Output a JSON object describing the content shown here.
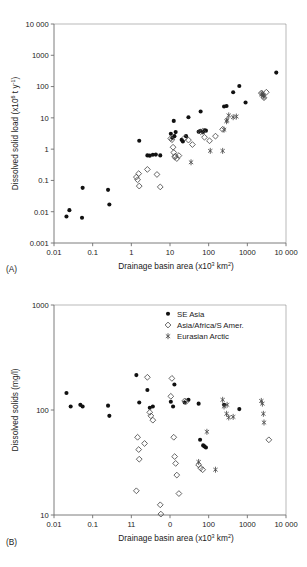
{
  "figure": {
    "legend": {
      "items": [
        {
          "label": "SE Asia",
          "marker": "filled-circle",
          "color": "#111111"
        },
        {
          "label": "Asia/Africa/S Amer.",
          "marker": "open-diamond",
          "color": "#4a4a4a"
        },
        {
          "label": "Eurasian Arctic",
          "marker": "asterisk",
          "color": "#4a4a4a"
        }
      ]
    }
  },
  "chart_data": [
    {
      "type": "scatter",
      "panel_label": "(A)",
      "title": "",
      "xlabel": "Drainage basin area (x10³ km²)",
      "ylabel": "Dissolved solid load (x10⁶ t y⁻¹)",
      "xscale": "log",
      "yscale": "log",
      "xlim": [
        0.01,
        10000
      ],
      "ylim": [
        0.001,
        10000
      ],
      "xticks": [
        0.01,
        0.1,
        1,
        10,
        100,
        1000,
        10000
      ],
      "xticklabels": [
        "0.01",
        "0.1",
        "1",
        "10",
        "100",
        "1000",
        "10 000"
      ],
      "yticks": [
        0.001,
        0.01,
        0.1,
        1,
        10,
        100,
        1000,
        10000
      ],
      "yticklabels": [
        "0.001",
        "0.01",
        "0.1",
        "1",
        "10",
        "100",
        "1000",
        "10 000"
      ],
      "grid": false,
      "legend_position": "none",
      "series": [
        {
          "name": "SE Asia",
          "marker": "filled-circle",
          "points": [
            [
              0.021,
              0.007
            ],
            [
              0.025,
              0.0112
            ],
            [
              0.053,
              0.0064
            ],
            [
              0.055,
              0.058
            ],
            [
              0.25,
              0.05
            ],
            [
              0.27,
              0.017
            ],
            [
              1.6,
              1.85
            ],
            [
              2.6,
              0.63
            ],
            [
              3.0,
              0.62
            ],
            [
              3.6,
              0.66
            ],
            [
              4.3,
              0.67
            ],
            [
              5.6,
              0.63
            ],
            [
              10.5,
              3.1
            ],
            [
              11.5,
              2.3
            ],
            [
              12.5,
              8.0
            ],
            [
              13.0,
              2.6
            ],
            [
              14.0,
              3.5
            ],
            [
              20.0,
              2.0
            ],
            [
              21.5,
              1.75
            ],
            [
              26.0,
              2.6
            ],
            [
              30.0,
              10.5
            ],
            [
              55.0,
              3.6
            ],
            [
              60.0,
              3.8
            ],
            [
              62.0,
              16.0
            ],
            [
              72.0,
              3.5
            ],
            [
              78.0,
              4.0
            ],
            [
              85.0,
              3.9
            ],
            [
              250.0,
              23.0
            ],
            [
              290.0,
              24.0
            ],
            [
              430.0,
              66.0
            ],
            [
              620.0,
              104.0
            ],
            [
              900.0,
              31.0
            ],
            [
              5600.0,
              280.0
            ]
          ]
        },
        {
          "name": "Asia/Africa/S Amer.",
          "marker": "open-diamond",
          "points": [
            [
              1.35,
              0.128
            ],
            [
              1.45,
              0.105
            ],
            [
              1.55,
              0.165
            ],
            [
              1.6,
              0.066
            ],
            [
              2.6,
              0.225
            ],
            [
              4.6,
              0.155
            ],
            [
              5.6,
              0.062
            ],
            [
              10.5,
              2.2
            ],
            [
              11.2,
              2.0
            ],
            [
              12.0,
              1.15
            ],
            [
              12.5,
              0.78
            ],
            [
              13.2,
              0.56
            ],
            [
              13.8,
              0.6
            ],
            [
              15.0,
              0.5
            ],
            [
              17.0,
              0.62
            ],
            [
              24.0,
              2.3
            ],
            [
              30.0,
              1.95
            ],
            [
              38.0,
              1.4
            ],
            [
              62.0,
              3.6
            ],
            [
              70.0,
              3.7
            ],
            [
              78.0,
              2.4
            ],
            [
              105.0,
              1.85
            ],
            [
              150.0,
              2.6
            ],
            [
              230.0,
              4.3
            ],
            [
              2300.0,
              62.0
            ],
            [
              2700.0,
              44.0
            ],
            [
              3100.0,
              66.0
            ]
          ]
        },
        {
          "name": "Eurasian Arctic",
          "marker": "asterisk",
          "points": [
            [
              35.0,
              0.38
            ],
            [
              110.0,
              0.88
            ],
            [
              230.0,
              0.88
            ],
            [
              250.0,
              4.2
            ],
            [
              290.0,
              7.8
            ],
            [
              300.0,
              8.5
            ],
            [
              330.0,
              12.0
            ],
            [
              430.0,
              10.5
            ],
            [
              520.0,
              11.0
            ],
            [
              2300.0,
              56.0
            ],
            [
              2450.0,
              60.0
            ],
            [
              2600.0,
              52.0
            ],
            [
              2700.0,
              47.0
            ]
          ]
        }
      ]
    },
    {
      "type": "scatter",
      "panel_label": "(B)",
      "title": "",
      "xlabel": "Drainage basin area (x10³ km²)",
      "ylabel": "Dissolved solids (mg/l)",
      "xscale": "log",
      "yscale": "log",
      "xlim": [
        0.01,
        10000
      ],
      "ylim": [
        10,
        1000
      ],
      "xticks": [
        0.01,
        0.1,
        1,
        10,
        100,
        1000,
        10000
      ],
      "xticklabels": [
        "0.01",
        "0.1",
        "11",
        "0",
        "100",
        "1000",
        "10 000"
      ],
      "yticks": [
        10,
        100,
        1000
      ],
      "yticklabels": [
        "10",
        "100",
        "1000"
      ],
      "grid": false,
      "legend_position": "top-right",
      "series": [
        {
          "name": "SE Asia",
          "marker": "filled-circle",
          "points": [
            [
              0.021,
              145.0
            ],
            [
              0.027,
              108.0
            ],
            [
              0.048,
              112.0
            ],
            [
              0.055,
              108.0
            ],
            [
              0.25,
              110.0
            ],
            [
              0.27,
              88.0
            ],
            [
              1.35,
              215.0
            ],
            [
              1.6,
              118.0
            ],
            [
              2.6,
              155.0
            ],
            [
              3.0,
              105.0
            ],
            [
              3.6,
              108.0
            ],
            [
              10.5,
              120.0
            ],
            [
              12.0,
              108.0
            ],
            [
              13.0,
              175.0
            ],
            [
              24.0,
              118.0
            ],
            [
              30.0,
              125.0
            ],
            [
              55.0,
              115.0
            ],
            [
              60.0,
              52.0
            ],
            [
              72.0,
              46.0
            ],
            [
              78.0,
              45.0
            ],
            [
              85.0,
              44.0
            ],
            [
              250.0,
              112.0
            ],
            [
              620.0,
              102.0
            ]
          ]
        },
        {
          "name": "Asia/Africa/S Amer.",
          "marker": "open-diamond",
          "points": [
            [
              1.35,
              17.0
            ],
            [
              1.45,
              55.0
            ],
            [
              1.55,
              42.0
            ],
            [
              1.6,
              34.0
            ],
            [
              2.2,
              48.0
            ],
            [
              2.6,
              205.0
            ],
            [
              3.0,
              95.0
            ],
            [
              3.2,
              88.0
            ],
            [
              3.6,
              80.0
            ],
            [
              5.6,
              12.5
            ],
            [
              5.8,
              10.2
            ],
            [
              10.5,
              135.0
            ],
            [
              11.2,
              200.0
            ],
            [
              12.5,
              55.0
            ],
            [
              13.2,
              36.0
            ],
            [
              14.0,
              31.0
            ],
            [
              15.0,
              24.0
            ],
            [
              17.0,
              16.0
            ],
            [
              24.0,
              122.0
            ],
            [
              26.0,
              120.0
            ],
            [
              55.0,
              30.0
            ],
            [
              62.0,
              28.0
            ],
            [
              70.0,
              27.0
            ],
            [
              3600.0,
              52.0
            ]
          ]
        },
        {
          "name": "Eurasian Arctic",
          "marker": "asterisk",
          "points": [
            [
              55.0,
              32.0
            ],
            [
              90.0,
              62.0
            ],
            [
              150.0,
              27.0
            ],
            [
              230.0,
              125.0
            ],
            [
              250.0,
              108.0
            ],
            [
              290.0,
              92.0
            ],
            [
              300.0,
              112.0
            ],
            [
              330.0,
              85.0
            ],
            [
              430.0,
              86.0
            ],
            [
              2300.0,
              122.0
            ],
            [
              2450.0,
              115.0
            ],
            [
              2600.0,
              92.0
            ],
            [
              2700.0,
              76.0
            ]
          ]
        }
      ]
    }
  ]
}
